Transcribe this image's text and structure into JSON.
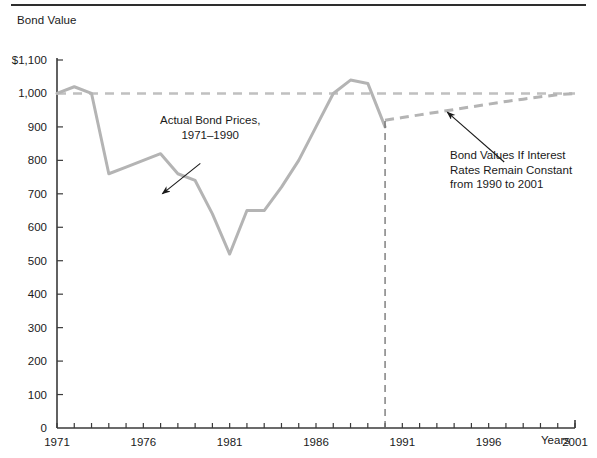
{
  "figure": {
    "width": 597,
    "height": 458,
    "background": "#ffffff",
    "rule_color": "#2e2e2e"
  },
  "chart_data": {
    "type": "line",
    "title": "",
    "ylabel": "Bond Value",
    "xlabel": "Years",
    "xlim": [
      1971,
      2001
    ],
    "ylim": [
      0,
      1100
    ],
    "grid": false,
    "legend": "none",
    "x_ticks": [
      1971,
      1972,
      1973,
      1974,
      1975,
      1976,
      1977,
      1978,
      1979,
      1980,
      1981,
      1982,
      1983,
      1984,
      1985,
      1986,
      1987,
      1988,
      1989,
      1990,
      1991,
      1992,
      1993,
      1994,
      1995,
      1996,
      1997,
      1998,
      1999,
      2000,
      2001
    ],
    "x_tick_labels": [
      "1971",
      "1976",
      "1981",
      "1986",
      "1991",
      "1996",
      "2001"
    ],
    "x_tick_label_values": [
      1971,
      1976,
      1981,
      1986,
      1991,
      1996,
      2001
    ],
    "y_ticks": [
      0,
      100,
      200,
      300,
      400,
      500,
      600,
      700,
      800,
      900,
      1000,
      1100
    ],
    "y_tick_labels": [
      "0",
      "100",
      "200",
      "300",
      "400",
      "500",
      "600",
      "700",
      "800",
      "900",
      "1,000",
      "1,100"
    ],
    "series": [
      {
        "name": "Actual Bond Prices, 1971-1990",
        "style": "solid",
        "color": "#b4b4b4",
        "x": [
          1971,
          1972,
          1973,
          1974,
          1975,
          1976,
          1977,
          1978,
          1979,
          1980,
          1981,
          1982,
          1983,
          1984,
          1985,
          1986,
          1987,
          1988,
          1989,
          1990
        ],
        "values": [
          1000,
          1020,
          1000,
          760,
          780,
          800,
          820,
          760,
          740,
          640,
          520,
          650,
          650,
          720,
          800,
          900,
          1000,
          1040,
          1030,
          900
        ]
      },
      {
        "name": "Bond Values If Interest Rates Remain Constant from 1990 to 2001",
        "style": "dashed",
        "color": "#b4b4b4",
        "x": [
          1990,
          1991,
          1992,
          1993,
          1994,
          1995,
          1996,
          1997,
          1998,
          1999,
          2000,
          2001
        ],
        "values": [
          920,
          928,
          936,
          944,
          952,
          960,
          968,
          976,
          983,
          990,
          996,
          1000
        ]
      },
      {
        "name": "Par value reference line",
        "style": "dashed",
        "color": "#c0c0c0",
        "x": [
          1971,
          2001
        ],
        "values": [
          1000,
          1000
        ]
      }
    ],
    "markers": [
      {
        "name": "1990-divider",
        "type": "vertical-dashed-line",
        "x": 1990,
        "y_from": 0,
        "y_to": 920,
        "color": "#6e6e6e"
      }
    ],
    "annotations": [
      {
        "id": "annotation-actual",
        "text": "Actual Bond Prices,\n1971–1990",
        "arrow_from": [
          1979.3,
          791
        ],
        "arrow_to": [
          1977.1,
          700
        ]
      },
      {
        "id": "annotation-forecast",
        "text": "Bond Values If Interest\nRates Remain Constant\nfrom 1990 to 2001",
        "arrow_from": [
          1996.9,
          795
        ],
        "arrow_to": [
          1993.6,
          944
        ]
      }
    ]
  },
  "axes": {
    "y_title": "Bond Value",
    "x_title": "Years",
    "y_top_label": "$1,100"
  }
}
